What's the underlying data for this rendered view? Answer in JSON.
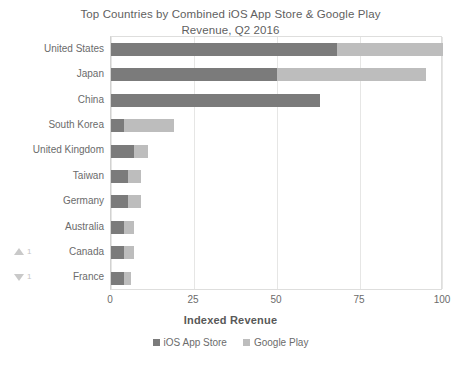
{
  "chart_data": {
    "type": "bar",
    "orientation": "horizontal",
    "stacked": true,
    "title": "Top Countries by Combined iOS App Store & Google Play Revenue, Q2 2016",
    "title_line1": "Top Countries by Combined iOS App Store & Google Play",
    "title_line2": "Revenue, Q2 2016",
    "xlabel": "Indexed Revenue",
    "ylabel": "",
    "xlim": [
      0,
      100
    ],
    "xticks": [
      0,
      25,
      50,
      75,
      100
    ],
    "xtick_labels": [
      "0",
      "25",
      "50",
      "75",
      "100"
    ],
    "grid": "vertical",
    "legend_position": "bottom-center",
    "categories": [
      "United States",
      "Japan",
      "China",
      "South Korea",
      "United Kingdom",
      "Taiwan",
      "Germany",
      "Australia",
      "Canada",
      "France"
    ],
    "series": [
      {
        "name": "iOS App Store",
        "color": "#7b7b7b",
        "values": [
          68,
          50,
          63,
          4,
          7,
          5,
          5,
          4,
          4,
          4
        ]
      },
      {
        "name": "Google Play",
        "color": "#bdbdbd",
        "values": [
          32,
          45,
          0,
          15,
          4,
          4,
          4,
          3,
          3,
          2
        ]
      }
    ],
    "totals": [
      100,
      95,
      63,
      19,
      11,
      9,
      9,
      7,
      7,
      6
    ],
    "annotations": [
      {
        "category": "Canada",
        "direction": "up",
        "value": "1",
        "icon": "triangle-up-icon",
        "color": "#c9c9c9"
      },
      {
        "category": "France",
        "direction": "down",
        "value": "1",
        "icon": "triangle-down-icon",
        "color": "#c9c9c9"
      }
    ]
  },
  "legend": {
    "items": [
      {
        "label": "iOS App Store",
        "color": "#7b7b7b"
      },
      {
        "label": "Google Play",
        "color": "#bdbdbd"
      }
    ]
  }
}
